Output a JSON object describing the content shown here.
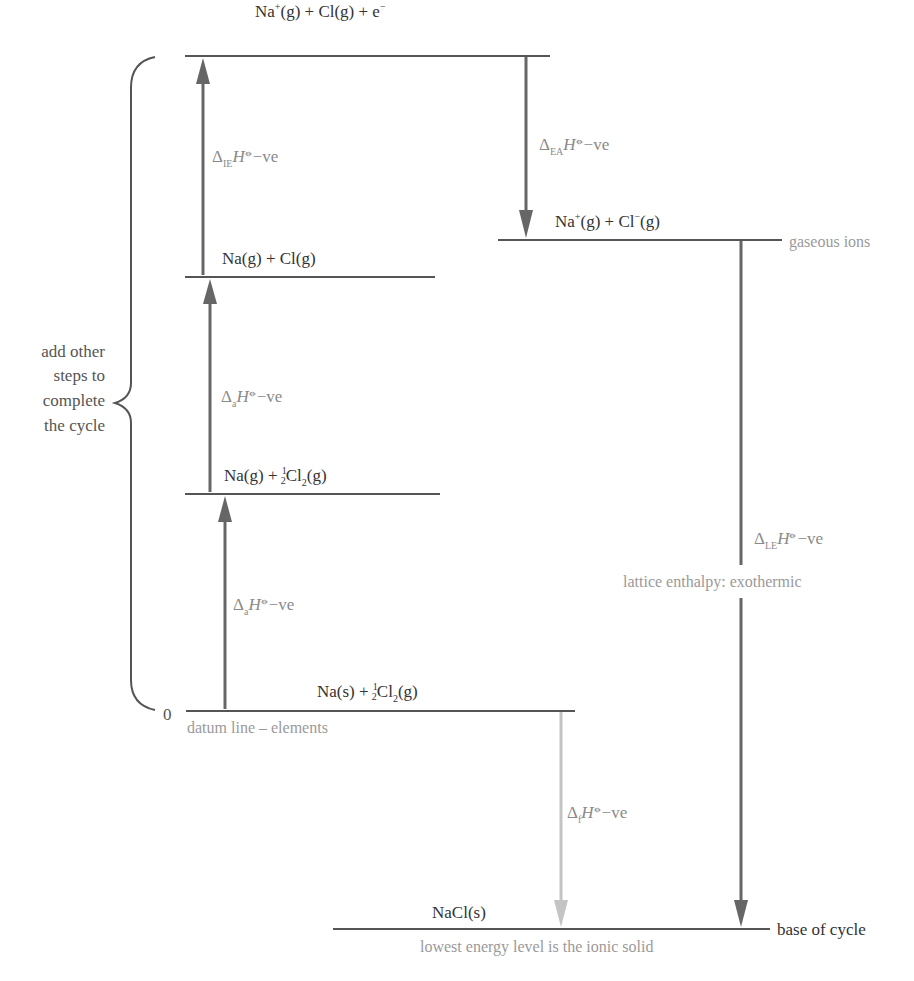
{
  "diagram": {
    "type": "Born-Haber cycle",
    "compound": "NaCl",
    "levels": {
      "top": {
        "species_a": "Na",
        "charge_a": "+",
        "phase_a": "(g)",
        "rest": " + Cl(g) + e",
        "charge_e": "−"
      },
      "gaseous_atoms": {
        "text": "Na(g) + Cl(g)"
      },
      "atomised_na": {
        "prefix": "Na(g) + ",
        "frac_num": "1",
        "frac_den": "2",
        "species": "Cl",
        "sub": "2",
        "phase": "(g)"
      },
      "elements": {
        "prefix": "Na(s) + ",
        "frac_num": "1",
        "frac_den": "2",
        "species": "Cl",
        "sub": "2",
        "phase": "(g)"
      },
      "gaseous_ions": {
        "text_a": "Na",
        "charge_a": "+",
        "mid": "(g) + Cl",
        "charge_b": "−",
        "end": "(g)"
      },
      "ionic_solid": {
        "text": "NaCl(s)"
      }
    },
    "steps": [
      {
        "id": "ionisation",
        "delta": "Δ",
        "sub": "IE",
        "symbol": "H",
        "std": "⦵",
        "sign": "−ve",
        "direction": "up"
      },
      {
        "id": "atomisation_cl",
        "delta": "Δ",
        "sub": "a",
        "symbol": "H",
        "std": "⦵",
        "sign": "−ve",
        "direction": "up"
      },
      {
        "id": "atomisation_na",
        "delta": "Δ",
        "sub": "a",
        "symbol": "H",
        "std": "⦵",
        "sign": "−ve",
        "direction": "up"
      },
      {
        "id": "electron_affinity",
        "delta": "Δ",
        "sub": "EA",
        "symbol": "H",
        "std": "⦵",
        "sign": "−ve",
        "direction": "down"
      },
      {
        "id": "lattice_enthalpy",
        "delta": "Δ",
        "sub": "LE",
        "symbol": "H",
        "std": "⦵",
        "sign": "−ve",
        "direction": "down"
      },
      {
        "id": "formation",
        "delta": "Δ",
        "sub": "f",
        "symbol": "H",
        "std": "⦵",
        "sign": "−ve",
        "direction": "down"
      }
    ],
    "annotations": {
      "brace_line1": "add other",
      "brace_line2": "steps to",
      "brace_line3": "complete",
      "brace_line4": "the cycle",
      "zero": "0",
      "datum": "datum line – elements",
      "gaseous_ions": "gaseous ions",
      "lattice": "lattice enthalpy: exothermic",
      "base": "base of cycle",
      "lowest": "lowest energy level is the ionic solid"
    },
    "colors": {
      "level_line": "#555555",
      "arrow_dark": "#666666",
      "arrow_light": "#c4c4c4",
      "note_text": "#9a9a9a"
    }
  }
}
